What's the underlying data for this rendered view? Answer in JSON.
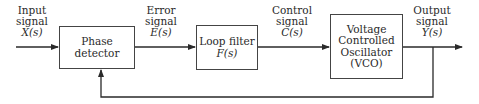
{
  "diagram": {
    "type": "block-diagram",
    "signals": {
      "input": {
        "line1": "Input",
        "line2": "signal",
        "symbol": "X(s)"
      },
      "error": {
        "line1": "Error",
        "line2": "signal",
        "symbol": "E(s)"
      },
      "control": {
        "line1": "Control",
        "line2": "signal",
        "symbol": "C(s)"
      },
      "output": {
        "line1": "Output",
        "line2": "signal",
        "symbol": "Y(s)"
      }
    },
    "blocks": {
      "phase_detector": {
        "line1": "Phase",
        "line2": "detector"
      },
      "loop_filter": {
        "line1": "Loop filter",
        "line2": "F(s)"
      },
      "vco": {
        "line1": "Voltage",
        "line2": "Controlled",
        "line3": "Oscillator",
        "line4": "(VCO)"
      }
    },
    "connections": [
      {
        "from": "input",
        "to": "phase_detector",
        "label": "X(s)"
      },
      {
        "from": "phase_detector",
        "to": "loop_filter",
        "label": "E(s)"
      },
      {
        "from": "loop_filter",
        "to": "vco",
        "label": "C(s)"
      },
      {
        "from": "vco",
        "to": "output",
        "label": "Y(s)"
      },
      {
        "from": "output",
        "to": "phase_detector",
        "label": "feedback"
      }
    ],
    "colors": {
      "line": "#2a2a2a",
      "box_border": "#444444",
      "background": "#ffffff"
    }
  }
}
